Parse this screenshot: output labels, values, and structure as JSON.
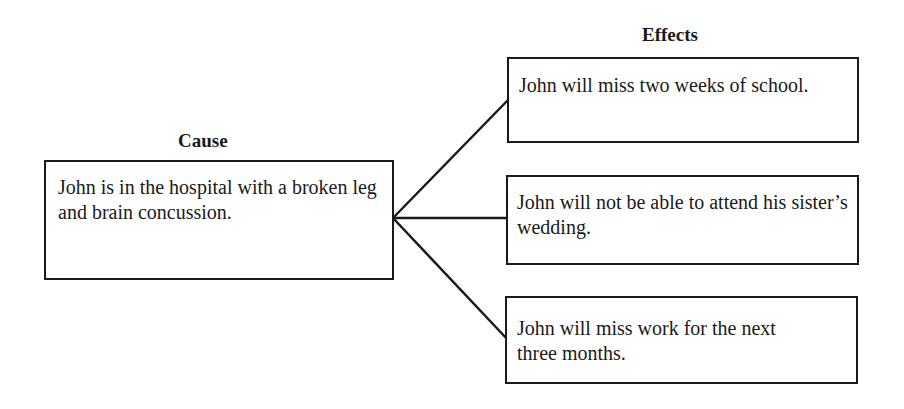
{
  "diagram": {
    "cause": {
      "heading": "Cause",
      "text": "John is in the hospital with a broken leg and brain concussion."
    },
    "effects": {
      "heading": "Effects",
      "items": [
        {
          "text": "John will miss two weeks of school."
        },
        {
          "text": "John will not be able to attend his sister’s wedding."
        },
        {
          "text": "John will miss work for the next three months."
        }
      ]
    }
  }
}
